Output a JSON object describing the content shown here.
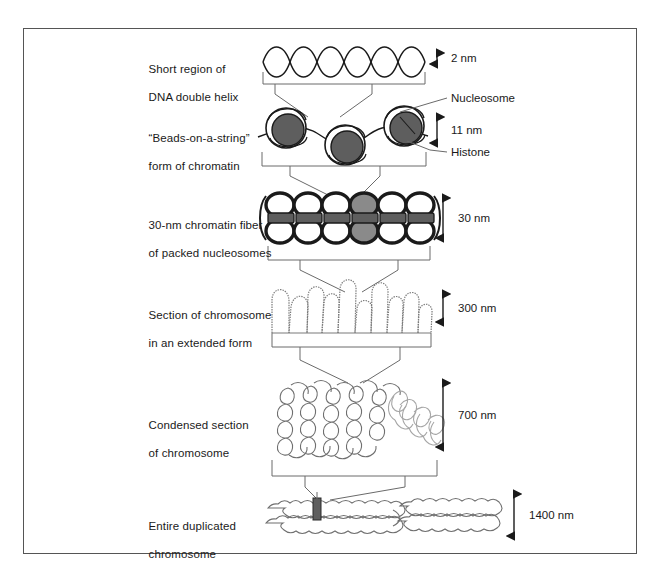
{
  "figure": {
    "frame_color": "#555555",
    "ink_color": "#1a1a1a",
    "bead_fill": "#5e5e5e",
    "highlight_fill": "#8a8a8a",
    "faint_ink": "#8f8f8f"
  },
  "levels": [
    {
      "label_line1": "Short region of",
      "label_line2": "DNA double helix",
      "scale": "2 nm"
    },
    {
      "label_line1": "“Beads-on-a-string”",
      "label_line2": "form of chromatin",
      "scale": "11 nm"
    },
    {
      "label_line1": "30-nm chromatin fiber",
      "label_line2": "of packed nucleosomes",
      "scale": "30 nm"
    },
    {
      "label_line1": "Section of chromosome",
      "label_line2": "in an extended form",
      "scale": "300 nm"
    },
    {
      "label_line1": "Condensed section",
      "label_line2": "of chromosome",
      "scale": "700 nm"
    },
    {
      "label_line1": "Entire duplicated",
      "label_line2": "chromosome",
      "scale": "1400 nm"
    }
  ],
  "callouts": [
    {
      "text": "Nucleosome"
    },
    {
      "text": "Histone"
    }
  ]
}
